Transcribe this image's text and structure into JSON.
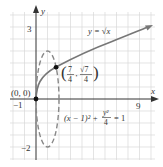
{
  "figure": {
    "type": "diagram",
    "colors": {
      "grid": "#d8d8d8",
      "axis": "#333333",
      "curve": "#777777",
      "ellipse": "#888888",
      "point": "#111111",
      "text": "#333333"
    },
    "axes": {
      "x_label": "x",
      "y_label": "y",
      "x_ticks": [
        {
          "value": -1,
          "label": "−1"
        },
        {
          "value": 9,
          "label": "9"
        }
      ],
      "y_ticks": [
        {
          "value": 3,
          "label": "3"
        },
        {
          "value": -2,
          "label": "−2"
        }
      ]
    },
    "curves": [
      {
        "name": "sqrt",
        "equation_label": "y = √x",
        "style": "solid"
      },
      {
        "name": "ellipse",
        "equation_label_lhs": "(x − 1)² + ",
        "equation_frac_num": "y²",
        "equation_frac_den": "4",
        "equation_rhs": "= 1",
        "style": "dashed"
      }
    ],
    "points": [
      {
        "label": "(0, 0)",
        "x": 0,
        "y": 0
      },
      {
        "label_num_x": "7",
        "label_den_x": "4",
        "label_num_y": "√7",
        "label_den_y": "4",
        "x": 1.75,
        "y": 1.3229
      }
    ]
  }
}
